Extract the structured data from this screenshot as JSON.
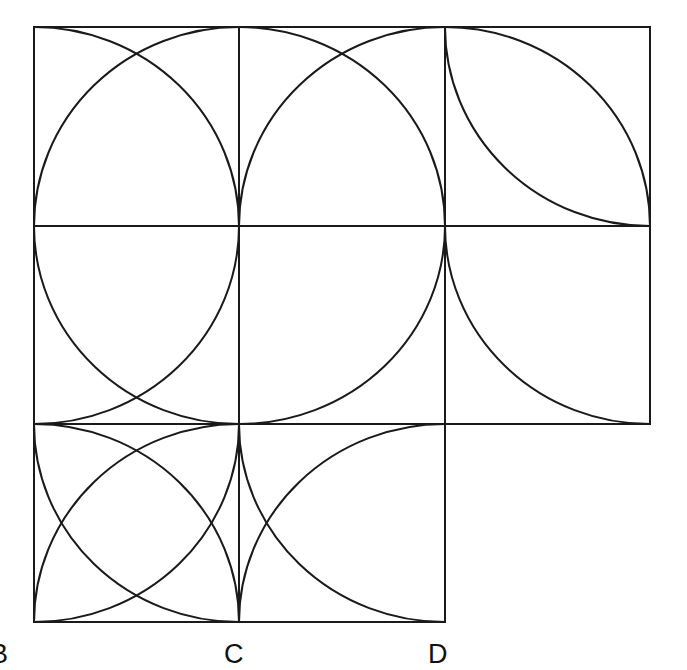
{
  "diagram": {
    "stroke_color": "#1a1a1a",
    "background": "#ffffff",
    "grid": {
      "x_lines": [
        34,
        239,
        445,
        650
      ],
      "y_lines": [
        27,
        226,
        424,
        622
      ]
    },
    "cells": [
      {
        "row": 0,
        "col": 0,
        "arcs": [
          "TR-BL@BR",
          "TL-BR@BL"
        ]
      },
      {
        "row": 0,
        "col": 1,
        "arcs": [
          "TL-BR@BL",
          "BL-TR@BR"
        ]
      },
      {
        "row": 0,
        "col": 2,
        "arcs": [
          "TL-BR@BL",
          "TL-BR@TR"
        ]
      },
      {
        "row": 1,
        "col": 0,
        "arcs": [
          "TL-BR@TR",
          "TR-BL@TL"
        ]
      },
      {
        "row": 1,
        "col": 1,
        "arcs": [
          "BL-TR@TL"
        ]
      },
      {
        "row": 1,
        "col": 2,
        "arcs": [
          "TL-BR@TR"
        ]
      },
      {
        "row": 2,
        "col": 0,
        "arcs": [
          "TL-BR@TR",
          "TL-BR@BL",
          "BL-TR@TL",
          "BL-TR@BR"
        ]
      },
      {
        "row": 2,
        "col": 1,
        "arcs": [
          "TL-BR@TR",
          "BL-TR@BR"
        ]
      }
    ],
    "labels": [
      {
        "id": "B",
        "text": "B",
        "x": -10,
        "y": 641
      },
      {
        "id": "C",
        "text": "C",
        "x": 224,
        "y": 641
      },
      {
        "id": "D",
        "text": "D",
        "x": 428,
        "y": 641
      }
    ]
  }
}
